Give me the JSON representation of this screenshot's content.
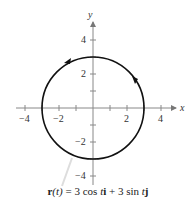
{
  "figure": {
    "axes": {
      "x_label": "x",
      "y_label": "y",
      "x_ticks": [
        -4,
        -3,
        -2,
        -1,
        1,
        2,
        3,
        4
      ],
      "x_tick_labels": {
        "-4": "−4",
        "-2": "−2",
        "2": "2",
        "4": "4"
      },
      "y_ticks": [
        -4,
        -3,
        -2,
        -1,
        1,
        2,
        3,
        4
      ],
      "y_tick_labels": {
        "4": "4",
        "2": "2",
        "-2": "−2",
        "-4": "−4"
      }
    },
    "curve": {
      "type": "circle",
      "center": [
        0,
        0
      ],
      "radius": 3,
      "orientation": "counterclockwise"
    },
    "caption": {
      "r": "r",
      "t1": "(t)",
      "eq": " = 3 cos ",
      "t2": "t",
      "i": "i",
      "plus": " + 3 sin ",
      "t3": "t",
      "j": "j"
    },
    "colors": {
      "curve": "#111111",
      "axis": "#777777"
    }
  }
}
